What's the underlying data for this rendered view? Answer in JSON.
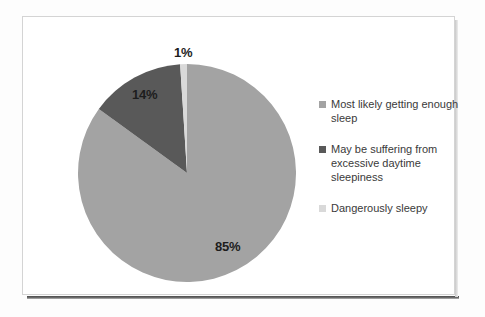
{
  "chart_data": {
    "type": "pie",
    "title": "",
    "categories": [
      "Most likely getting enough sleep",
      "May be suffering from excessive daytime sleepiness",
      "Dangerously sleepy"
    ],
    "values": [
      85,
      14,
      1
    ],
    "value_labels": [
      "85%",
      "14%",
      "1%"
    ],
    "units": "percent",
    "colors": [
      "#a3a3a3",
      "#595959",
      "#d9d9d9"
    ],
    "legend_position": "right",
    "grid": false,
    "start_angle_deg": 0,
    "direction": "clockwise"
  },
  "labels": {
    "slice_1_percent": "85%",
    "slice_2_percent": "14%",
    "slice_3_percent": "1%"
  },
  "legend": {
    "items": [
      {
        "label": "Most likely getting enough sleep",
        "color": "#a3a3a3"
      },
      {
        "label": "May be suffering from excessive daytime sleepiness",
        "color": "#595959"
      },
      {
        "label": "Dangerously sleepy",
        "color": "#d9d9d9"
      }
    ]
  }
}
